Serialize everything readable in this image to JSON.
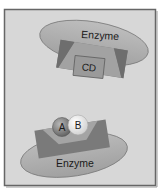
{
  "diagram": {
    "colors": {
      "background": "#ffffff",
      "panel": "#d6d6d6",
      "panel_border": "#6a6a6a",
      "enzyme_fill": "#a9a9a9",
      "enzyme_stroke": "#7a7a7a",
      "active_site_block": "#777777",
      "active_site_notch": "#a4a4a4",
      "product_box": "#999999",
      "substrate_a": "#7e7e7e",
      "substrate_b": "#f2f2f2",
      "text": "#1a1a1a"
    },
    "top": {
      "enzyme_label": "Enzyme",
      "product_label": "CD"
    },
    "bottom": {
      "enzyme_label": "Enzyme",
      "substrate_a_label": "A",
      "substrate_b_label": "B"
    }
  }
}
